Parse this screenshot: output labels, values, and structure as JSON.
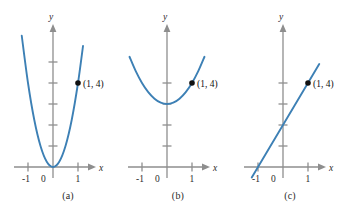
{
  "figure": {
    "panels": [
      {
        "caption": "(a)",
        "axis_x_label": "x",
        "axis_y_label": "y",
        "x_tick_labels": [
          "-1",
          "0",
          "1"
        ],
        "point_label": "(1, 4)",
        "point": {
          "x": 1,
          "y": 4
        },
        "curve_color": "#3d80b5",
        "axis_color": "#8e8e8e"
      },
      {
        "caption": "(b)",
        "axis_x_label": "x",
        "axis_y_label": "y",
        "x_tick_labels": [
          "-1",
          "0",
          "1"
        ],
        "point_label": "(1, 4)",
        "point": {
          "x": 1,
          "y": 4
        },
        "curve_color": "#3d80b5",
        "axis_color": "#8e8e8e"
      },
      {
        "caption": "(c)",
        "axis_x_label": "x",
        "axis_y_label": "y",
        "x_tick_labels": [
          "-1",
          "0",
          "1"
        ],
        "point_label": "(1, 4)",
        "point": {
          "x": 1,
          "y": 4
        },
        "curve_color": "#3d80b5",
        "axis_color": "#8e8e8e"
      }
    ]
  },
  "chart_data": [
    {
      "type": "line",
      "title": "(a)",
      "xlabel": "x",
      "ylabel": "y",
      "xlim": [
        -1.6,
        1.6
      ],
      "ylim": [
        -0.6,
        6.6
      ],
      "grid": false,
      "legend": null,
      "x_ticks": [
        -1,
        0,
        1
      ],
      "x_tick_labels": [
        "-1",
        "0",
        "1"
      ],
      "y_ticks": [
        1,
        2,
        3,
        4,
        5
      ],
      "y_tick_labels": [
        "",
        "",
        "",
        "",
        ""
      ],
      "series": [
        {
          "name": "y = 4x^2",
          "x": [
            -1.25,
            -1.0,
            -0.75,
            -0.5,
            -0.25,
            0,
            0.25,
            0.5,
            0.75,
            1.0,
            1.2
          ],
          "values": [
            6.25,
            4.0,
            2.25,
            1.0,
            0.25,
            0,
            0.25,
            1.0,
            2.25,
            4.0,
            5.76
          ]
        }
      ],
      "annotations": [
        {
          "text": "(1, 4)",
          "x": 1,
          "y": 4,
          "marker": "filled-dot"
        }
      ]
    },
    {
      "type": "line",
      "title": "(b)",
      "xlabel": "x",
      "ylabel": "y",
      "xlim": [
        -1.6,
        1.6
      ],
      "ylim": [
        -0.6,
        6.6
      ],
      "grid": false,
      "legend": null,
      "x_ticks": [
        -1,
        0,
        1
      ],
      "x_tick_labels": [
        "-1",
        "0",
        "1"
      ],
      "y_ticks": [
        1,
        2,
        3,
        4
      ],
      "y_tick_labels": [
        "",
        "",
        "",
        ""
      ],
      "series": [
        {
          "name": "y = x^2 + 3",
          "x": [
            -1.5,
            -1.25,
            -1.0,
            -0.75,
            -0.5,
            -0.25,
            0,
            0.25,
            0.5,
            0.75,
            1.0,
            1.25,
            1.5
          ],
          "values": [
            5.25,
            4.5625,
            4.0,
            3.5625,
            3.25,
            3.0625,
            3.0,
            3.0625,
            3.25,
            3.5625,
            4.0,
            4.5625,
            5.25
          ]
        }
      ],
      "annotations": [
        {
          "text": "(1, 4)",
          "x": 1,
          "y": 4,
          "marker": "filled-dot"
        }
      ]
    },
    {
      "type": "line",
      "title": "(c)",
      "xlabel": "x",
      "ylabel": "y",
      "xlim": [
        -1.6,
        1.6
      ],
      "ylim": [
        -0.6,
        6.6
      ],
      "grid": false,
      "legend": null,
      "x_ticks": [
        -1,
        0,
        1
      ],
      "x_tick_labels": [
        "-1",
        "0",
        "1"
      ],
      "y_ticks": [
        1,
        2,
        3,
        4
      ],
      "y_tick_labels": [
        "",
        "",
        "",
        ""
      ],
      "series": [
        {
          "name": "y = 2x + 2",
          "x": [
            -1.25,
            1.45
          ],
          "values": [
            -0.5,
            4.9
          ]
        }
      ],
      "annotations": [
        {
          "text": "(1, 4)",
          "x": 1,
          "y": 4,
          "marker": "filled-dot"
        }
      ]
    }
  ]
}
